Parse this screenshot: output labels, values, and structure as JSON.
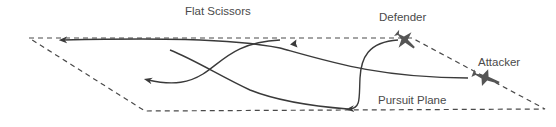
{
  "diagram": {
    "title": "Flat Scissors",
    "labels": {
      "defender": "Defender",
      "attacker": "Attacker",
      "plane": "Pursuit Plane"
    },
    "colors": {
      "line": "#3a3a3a",
      "dash": "#4a4a4a",
      "jet": "#555555",
      "text": "#4a4a4a"
    }
  }
}
